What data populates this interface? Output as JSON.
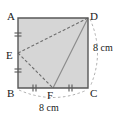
{
  "figure": {
    "kind": "geometry-diagram",
    "shape": "square",
    "fill_color": "#d6d6d6",
    "stroke_color": "#585858",
    "dash_color": "#7a7a7a",
    "arc_color": "#9a9a9a",
    "text_color": "#1a1a1a",
    "vertices": [
      {
        "name": "A",
        "label": "A",
        "x": 18,
        "y": 18,
        "role": "top-left-corner"
      },
      {
        "name": "B",
        "label": "B",
        "x": 18,
        "y": 88,
        "role": "bottom-left-corner"
      },
      {
        "name": "C",
        "label": "C",
        "x": 88,
        "y": 88,
        "role": "bottom-right-corner"
      },
      {
        "name": "D",
        "label": "D",
        "x": 88,
        "y": 18,
        "role": "top-right-corner"
      },
      {
        "name": "E",
        "label": "E",
        "x": 18,
        "y": 53,
        "role": "midpoint-of-AB"
      },
      {
        "name": "F",
        "label": "F",
        "x": 53,
        "y": 88,
        "role": "midpoint-of-BC"
      }
    ],
    "segments": [
      {
        "name": "side-AB",
        "from": "A",
        "to": "B",
        "style": "solid"
      },
      {
        "name": "side-BC",
        "from": "B",
        "to": "C",
        "style": "solid"
      },
      {
        "name": "side-CD",
        "from": "C",
        "to": "D",
        "style": "solid"
      },
      {
        "name": "side-DA",
        "from": "D",
        "to": "A",
        "style": "solid"
      },
      {
        "name": "segment-ED",
        "from": "E",
        "to": "D",
        "style": "dashed"
      },
      {
        "name": "segment-EF",
        "from": "E",
        "to": "F",
        "style": "dashed"
      },
      {
        "name": "segment-DF",
        "from": "D",
        "to": "F",
        "style": "solid"
      }
    ],
    "tick_marks": [
      {
        "name": "tick-AE",
        "on_segment": "A-E",
        "count": 2,
        "orientation": "horizontal"
      },
      {
        "name": "tick-EB",
        "on_segment": "E-B",
        "count": 2,
        "orientation": "horizontal"
      },
      {
        "name": "tick-BF",
        "on_segment": "B-F",
        "count": 2,
        "orientation": "vertical"
      },
      {
        "name": "tick-FC",
        "on_segment": "F-C",
        "count": 2,
        "orientation": "vertical"
      }
    ],
    "dimensions": [
      {
        "name": "right-side-length",
        "label": "8 cm",
        "measures": "DC",
        "arc": "right"
      },
      {
        "name": "bottom-side-length",
        "label": "8 cm",
        "measures": "BC",
        "arc": "bottom"
      }
    ]
  }
}
